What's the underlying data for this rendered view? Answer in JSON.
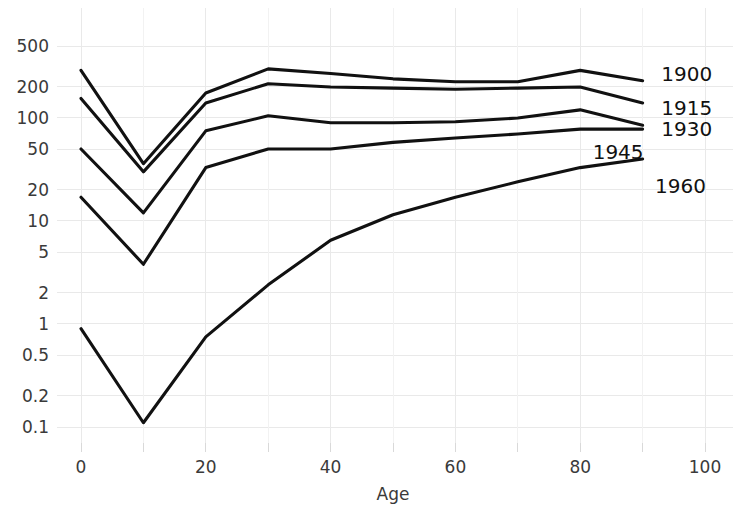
{
  "chart_data": {
    "type": "line",
    "title": "",
    "subtitle": "",
    "xlabel": "Age",
    "ylabel": "",
    "yscale": "log",
    "xscale": "linear",
    "xlim": [
      0,
      100
    ],
    "ylim": [
      0.09,
      700
    ],
    "grid": true,
    "legend_position": "right-inline-labels",
    "x": [
      0,
      10,
      20,
      30,
      40,
      50,
      60,
      70,
      80,
      90
    ],
    "xticks": [
      0,
      20,
      40,
      60,
      80,
      100
    ],
    "xticklabels": [
      "0",
      "20",
      "40",
      "60",
      "80",
      "100"
    ],
    "xminorticks": [
      10,
      30,
      50,
      70,
      90
    ],
    "yticks": [
      0.1,
      0.2,
      0.5,
      1,
      2,
      5,
      10,
      20,
      50,
      100,
      200,
      500
    ],
    "yticklabels": [
      "0.1",
      "0.2",
      "0.5",
      "1",
      "2",
      "5",
      "10",
      "20",
      "50",
      "100",
      "200",
      "500"
    ],
    "series": [
      {
        "name": "1900",
        "label": "1900",
        "color": "#111111",
        "values": [
          290,
          36,
          175,
          300,
          270,
          240,
          225,
          225,
          290,
          230
        ]
      },
      {
        "name": "1915",
        "label": "1915",
        "color": "#111111",
        "values": [
          155,
          30,
          140,
          215,
          200,
          195,
          190,
          195,
          200,
          140
        ]
      },
      {
        "name": "1930",
        "label": "1930",
        "color": "#111111",
        "values": [
          50,
          12,
          75,
          105,
          90,
          90,
          92,
          100,
          120,
          85
        ]
      },
      {
        "name": "1945",
        "label": "1945",
        "color": "#111111",
        "values": [
          17,
          3.8,
          33,
          50,
          50,
          58,
          64,
          70,
          78,
          78
        ]
      },
      {
        "name": "1960",
        "label": "1960",
        "color": "#111111",
        "values": [
          0.9,
          0.11,
          0.75,
          2.4,
          6.5,
          11.5,
          17,
          24,
          33,
          40
        ]
      }
    ],
    "series_label_positions": [
      {
        "label": "1900",
        "x": 93,
        "y": 270
      },
      {
        "label": "1915",
        "x": 93,
        "y": 125
      },
      {
        "label": "1930",
        "x": 93,
        "y": 78
      },
      {
        "label": "1945",
        "x": 82,
        "y": 47
      },
      {
        "label": "1960",
        "x": 92,
        "y": 22
      }
    ]
  },
  "axes": {
    "x_title": "Age"
  }
}
